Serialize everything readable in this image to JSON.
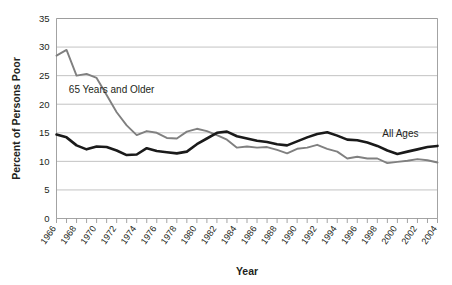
{
  "chart_data": {
    "type": "line",
    "title": "",
    "xlabel": "Year",
    "ylabel": "Percent of Persons Poor",
    "xlim": [
      1966,
      2004
    ],
    "ylim": [
      0,
      35
    ],
    "yticks": [
      0,
      5,
      10,
      15,
      20,
      25,
      30,
      35
    ],
    "xticks": [
      1966,
      1968,
      1970,
      1972,
      1974,
      1976,
      1978,
      1980,
      1982,
      1984,
      1986,
      1988,
      1990,
      1992,
      1994,
      1996,
      1998,
      2000,
      2002,
      2004
    ],
    "xtick_labels": [
      "1966",
      "1968",
      "1970",
      "1972",
      "1974",
      "1976",
      "1978",
      "1980",
      "1982",
      "1984",
      "1986",
      "1988",
      "1990",
      "1992",
      "1994",
      "1996",
      "1998",
      "2000",
      "2002",
      "2004"
    ],
    "ytick_labels": [
      "0",
      "5",
      "10",
      "15",
      "20",
      "25",
      "30",
      "35"
    ],
    "grid": true,
    "grid_axis": "y",
    "legend_position": "inline-annotation",
    "x": [
      1966,
      1967,
      1968,
      1969,
      1970,
      1971,
      1972,
      1973,
      1974,
      1975,
      1976,
      1977,
      1978,
      1979,
      1980,
      1981,
      1982,
      1983,
      1984,
      1985,
      1986,
      1987,
      1988,
      1989,
      1990,
      1991,
      1992,
      1993,
      1994,
      1995,
      1996,
      1997,
      1998,
      1999,
      2000,
      2001,
      2002,
      2003,
      2004
    ],
    "series": [
      {
        "name": "65 Years and Older",
        "color": "#808080",
        "label_x": 1971.5,
        "label_y": 22.0,
        "values": [
          28.5,
          29.5,
          25.0,
          25.3,
          24.6,
          21.6,
          18.6,
          16.3,
          14.6,
          15.3,
          15.0,
          14.1,
          14.0,
          15.2,
          15.7,
          15.3,
          14.6,
          13.8,
          12.4,
          12.6,
          12.4,
          12.5,
          12.0,
          11.4,
          12.2,
          12.4,
          12.9,
          12.2,
          11.7,
          10.5,
          10.8,
          10.5,
          10.5,
          9.7,
          9.9,
          10.1,
          10.4,
          10.2,
          9.8
        ]
      },
      {
        "name": "All Ages",
        "color": "#1a1a1a",
        "label_x": 2000.3,
        "label_y": 14.3,
        "values": [
          14.7,
          14.2,
          12.8,
          12.1,
          12.6,
          12.5,
          11.9,
          11.1,
          11.2,
          12.3,
          11.8,
          11.6,
          11.4,
          11.7,
          13.0,
          14.0,
          15.0,
          15.2,
          14.4,
          14.0,
          13.6,
          13.4,
          13.0,
          12.8,
          13.5,
          14.2,
          14.8,
          15.1,
          14.5,
          13.8,
          13.7,
          13.3,
          12.7,
          11.9,
          11.3,
          11.7,
          12.1,
          12.5,
          12.7
        ]
      }
    ]
  }
}
